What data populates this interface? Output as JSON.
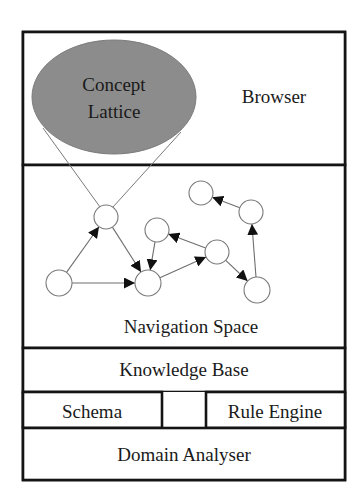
{
  "diagram": {
    "layers": {
      "browser": {
        "label": "Browser"
      },
      "concept_lattice": {
        "line1": "Concept",
        "line2": "Lattice",
        "fill": "#8c8c8c"
      },
      "navigation_space": {
        "label": "Navigation Space"
      },
      "knowledge_base": {
        "label": "Knowledge Base"
      },
      "schema": {
        "label": "Schema"
      },
      "rule_engine": {
        "label": "Rule Engine"
      },
      "domain_analyser": {
        "label": "Domain Analyser"
      }
    },
    "graph": {
      "nodes": [
        {
          "id": "A",
          "x": 106,
          "y": 217,
          "r": 12
        },
        {
          "id": "B",
          "x": 59,
          "y": 283,
          "r": 13
        },
        {
          "id": "C",
          "x": 148,
          "y": 283,
          "r": 13
        },
        {
          "id": "D",
          "x": 157,
          "y": 230,
          "r": 12
        },
        {
          "id": "E",
          "x": 201,
          "y": 193,
          "r": 12
        },
        {
          "id": "F",
          "x": 251,
          "y": 212,
          "r": 12
        },
        {
          "id": "G",
          "x": 217,
          "y": 252,
          "r": 12
        },
        {
          "id": "H",
          "x": 257,
          "y": 290,
          "r": 13
        }
      ],
      "edges": [
        {
          "from": "B",
          "to": "A"
        },
        {
          "from": "B",
          "to": "C"
        },
        {
          "from": "A",
          "to": "C"
        },
        {
          "from": "D",
          "to": "C"
        },
        {
          "from": "C",
          "to": "G"
        },
        {
          "from": "G",
          "to": "D"
        },
        {
          "from": "G",
          "to": "H"
        },
        {
          "from": "H",
          "to": "F"
        },
        {
          "from": "F",
          "to": "E"
        }
      ]
    },
    "colors": {
      "border": "#141414",
      "lattice_fill": "#8c8c8c",
      "edge": "#6e6e6e",
      "text": "#1a1a1a"
    }
  }
}
